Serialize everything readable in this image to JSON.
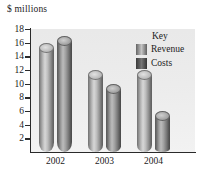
{
  "chart_data": {
    "type": "bar",
    "title": "$ millions",
    "xlabel": "",
    "ylabel": "$ millions",
    "categories": [
      "2002",
      "2003",
      "2004"
    ],
    "series": [
      {
        "name": "Revenue",
        "values": [
          16,
          12,
          12
        ],
        "color": "#9e9e9e"
      },
      {
        "name": "Costs",
        "values": [
          17,
          10,
          6
        ],
        "color": "#5c5c5c"
      }
    ],
    "ylim": [
      0,
      18
    ],
    "yticks": [
      2,
      4,
      6,
      8,
      10,
      12,
      14,
      16,
      18
    ],
    "ytick_labels": [
      "2",
      "4",
      "6",
      "8",
      "10",
      "12",
      "14",
      "16",
      "18"
    ],
    "grid": false,
    "legend_position": "upper right",
    "legend_title": "Key",
    "bar_style": "cylinder-3d"
  },
  "legend": {
    "title": "Key",
    "entries": [
      {
        "label": "Revenue"
      },
      {
        "label": "Costs"
      }
    ]
  }
}
